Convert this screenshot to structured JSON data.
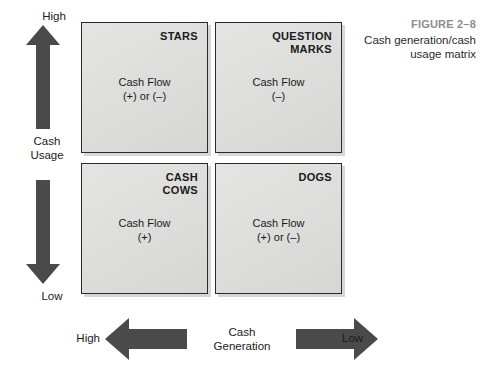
{
  "caption": {
    "number": "FIGURE 2–8",
    "title": "Cash generation/cash usage matrix"
  },
  "matrix": {
    "quadrants": [
      {
        "id": "stars",
        "title": "STARS",
        "cash_flow_label": "Cash Flow",
        "cash_flow_value": "(+) or (–)"
      },
      {
        "id": "question-marks",
        "title": "QUESTION\nMARKS",
        "cash_flow_label": "Cash Flow",
        "cash_flow_value": "(–)"
      },
      {
        "id": "cash-cows",
        "title": "CASH\nCOWS",
        "cash_flow_label": "Cash Flow",
        "cash_flow_value": "(+)"
      },
      {
        "id": "dogs",
        "title": "DOGS",
        "cash_flow_label": "Cash Flow",
        "cash_flow_value": "(+) or (–)"
      }
    ]
  },
  "axes": {
    "vertical": {
      "name": "Cash\nUsage",
      "high_label": "High",
      "low_label": "Low"
    },
    "horizontal": {
      "name": "Cash\nGeneration",
      "high_label": "High",
      "low_label": "Low"
    }
  },
  "colors": {
    "arrow": "#4a4a4a",
    "quadrant_fill": "#dededc",
    "quadrant_border": "#2a2a2a",
    "caption_number": "#8d8d8d",
    "text": "#1a1a1a"
  }
}
